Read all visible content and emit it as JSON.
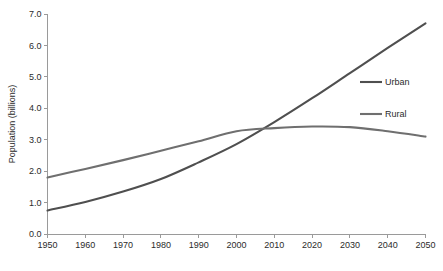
{
  "chart_data": {
    "type": "line",
    "title": "",
    "xlabel": "",
    "ylabel": "Population (billions)",
    "xlim": [
      1950,
      2050
    ],
    "ylim": [
      0.0,
      7.0
    ],
    "grid": false,
    "legend_position": "right",
    "x": [
      1950,
      1960,
      1970,
      1980,
      1990,
      2000,
      2010,
      2020,
      2030,
      2040,
      2050
    ],
    "xticklabels": [
      "1950",
      "1960",
      "1970",
      "1980",
      "1990",
      "2000",
      "2010",
      "2020",
      "2030",
      "2040",
      "2050"
    ],
    "yticks": [
      0.0,
      1.0,
      2.0,
      3.0,
      4.0,
      5.0,
      6.0,
      7.0
    ],
    "yticklabels": [
      "0.0",
      "1.0",
      "2.0",
      "3.0",
      "4.0",
      "5.0",
      "6.0",
      "7.0"
    ],
    "series": [
      {
        "name": "Urban",
        "color": "#4f4f4f",
        "values": [
          0.75,
          1.02,
          1.35,
          1.75,
          2.28,
          2.86,
          3.56,
          4.32,
          5.12,
          5.92,
          6.7
        ]
      },
      {
        "name": "Rural",
        "color": "#6f6f6f",
        "values": [
          1.8,
          2.07,
          2.35,
          2.65,
          2.95,
          3.27,
          3.37,
          3.42,
          3.4,
          3.27,
          3.1
        ]
      }
    ],
    "annotations": [],
    "crossover": {
      "year": 2007,
      "value": 3.33
    }
  },
  "legend": {
    "items": [
      {
        "label": "Urban",
        "color": "#4f4f4f"
      },
      {
        "label": "Rural",
        "color": "#6f6f6f"
      }
    ]
  },
  "axes": {
    "y_title": "Population (billions)"
  }
}
